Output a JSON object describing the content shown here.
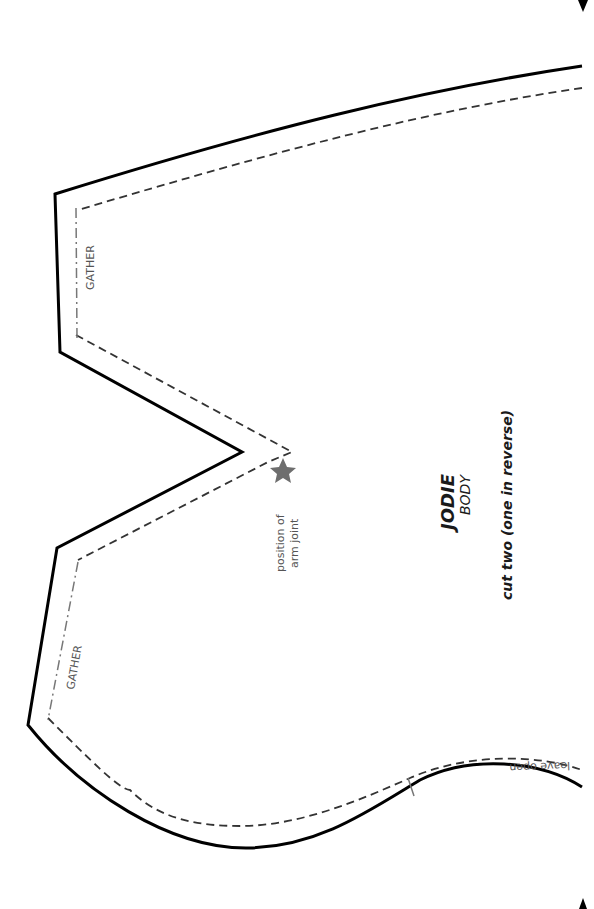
{
  "pattern": {
    "title": "JODIE",
    "piece": "BODY",
    "instruction": "cut two (one in reverse)"
  },
  "labels": {
    "gather_top": "GATHER",
    "gather_bottom": "GATHER",
    "arm_joint_line1": "position of",
    "arm_joint_line2": "arm joint",
    "leave_open": "leave open"
  },
  "icons": {
    "arm_joint_marker": "star-icon",
    "registration_mark": "triangle-icon"
  },
  "colors": {
    "cut_line": "#000000",
    "seam_line": "#333333",
    "gather_line": "#777777",
    "star": "#6e6e6e",
    "label_text": "#555555"
  }
}
